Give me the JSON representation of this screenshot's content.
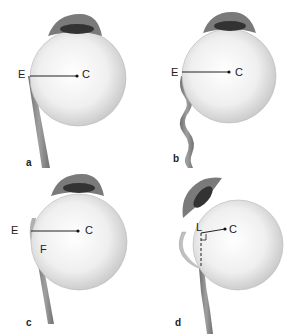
{
  "figure": {
    "panels": [
      {
        "id": "a",
        "label": "a",
        "points": {
          "E": "E",
          "C": "C"
        },
        "nerve": "straight, attached at E"
      },
      {
        "id": "b",
        "label": "b",
        "points": {
          "E": "E",
          "C": "C"
        },
        "nerve": "wavy, attached at E"
      },
      {
        "id": "c",
        "label": "c",
        "points": {
          "E": "E",
          "C": "C",
          "F": "F"
        },
        "nerve": "straight, attached at F"
      },
      {
        "id": "d",
        "label": "d",
        "points": {
          "L": "L",
          "C": "C"
        },
        "nerve": "straight with dashed extension to L, right angle marker"
      }
    ],
    "colors": {
      "globe": "#f2f2f2",
      "globe_shadow": "#c8c8c8",
      "cornea": "#6e6e6e",
      "pupil": "#3a3a3a",
      "nerve": "#8a8a8a",
      "line": "#222222"
    }
  }
}
